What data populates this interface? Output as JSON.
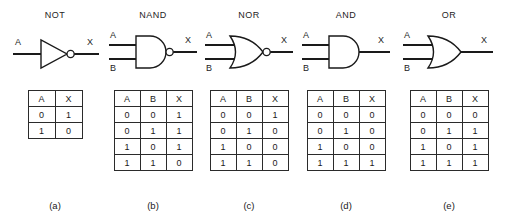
{
  "figure": {
    "background": "#ffffff",
    "line_color": "#1a1a1a",
    "gates": [
      {
        "title": "NOT",
        "caption": "(a)",
        "shape": "not-gate",
        "inputs": [
          "A"
        ],
        "output": "X",
        "bubble": true,
        "table": {
          "headers": [
            "A",
            "X"
          ],
          "rows": [
            [
              "0",
              "1"
            ],
            [
              "1",
              "0"
            ]
          ]
        }
      },
      {
        "title": "NAND",
        "caption": "(b)",
        "shape": "nand-gate",
        "inputs": [
          "A",
          "B"
        ],
        "output": "X",
        "bubble": true,
        "table": {
          "headers": [
            "A",
            "B",
            "X"
          ],
          "rows": [
            [
              "0",
              "0",
              "1"
            ],
            [
              "0",
              "1",
              "1"
            ],
            [
              "1",
              "0",
              "1"
            ],
            [
              "1",
              "1",
              "0"
            ]
          ]
        }
      },
      {
        "title": "NOR",
        "caption": "(c)",
        "shape": "nor-gate",
        "inputs": [
          "A",
          "B"
        ],
        "output": "X",
        "bubble": true,
        "table": {
          "headers": [
            "A",
            "B",
            "X"
          ],
          "rows": [
            [
              "0",
              "0",
              "1"
            ],
            [
              "0",
              "1",
              "0"
            ],
            [
              "1",
              "0",
              "0"
            ],
            [
              "1",
              "1",
              "0"
            ]
          ]
        }
      },
      {
        "title": "AND",
        "caption": "(d)",
        "shape": "and-gate",
        "inputs": [
          "A",
          "B"
        ],
        "output": "X",
        "bubble": false,
        "table": {
          "headers": [
            "A",
            "B",
            "X"
          ],
          "rows": [
            [
              "0",
              "0",
              "0"
            ],
            [
              "0",
              "1",
              "0"
            ],
            [
              "1",
              "0",
              "0"
            ],
            [
              "1",
              "1",
              "1"
            ]
          ]
        }
      },
      {
        "title": "OR",
        "caption": "(e)",
        "shape": "or-gate",
        "inputs": [
          "A",
          "B"
        ],
        "output": "X",
        "bubble": false,
        "table": {
          "headers": [
            "A",
            "B",
            "X"
          ],
          "rows": [
            [
              "0",
              "0",
              "0"
            ],
            [
              "0",
              "1",
              "1"
            ],
            [
              "1",
              "0",
              "1"
            ],
            [
              "1",
              "1",
              "1"
            ]
          ]
        }
      }
    ]
  }
}
